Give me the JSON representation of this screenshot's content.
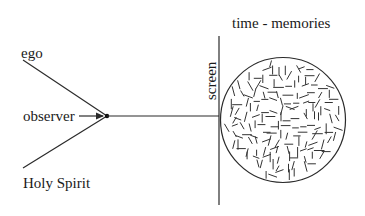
{
  "diagram": {
    "labels": {
      "ego": "ego",
      "observer": "observer",
      "holy_spirit": "Holy Spirit",
      "screen": "screen",
      "time_memories": "time - memories"
    },
    "nodes": [
      {
        "id": "ego",
        "label": "ego"
      },
      {
        "id": "observer",
        "label": "observer"
      },
      {
        "id": "holy_spirit",
        "label": "Holy Spirit"
      },
      {
        "id": "junction",
        "label": ""
      },
      {
        "id": "screen",
        "label": "screen"
      },
      {
        "id": "time_memories",
        "label": "time - memories"
      }
    ],
    "edges": [
      {
        "from": "ego",
        "to": "junction",
        "type": "line"
      },
      {
        "from": "holy_spirit",
        "to": "junction",
        "type": "line"
      },
      {
        "from": "observer",
        "to": "junction",
        "type": "arrow"
      },
      {
        "from": "junction",
        "to": "screen",
        "type": "line"
      }
    ],
    "colors": {
      "stroke": "#2a2a2a",
      "background": "#ffffff"
    }
  }
}
